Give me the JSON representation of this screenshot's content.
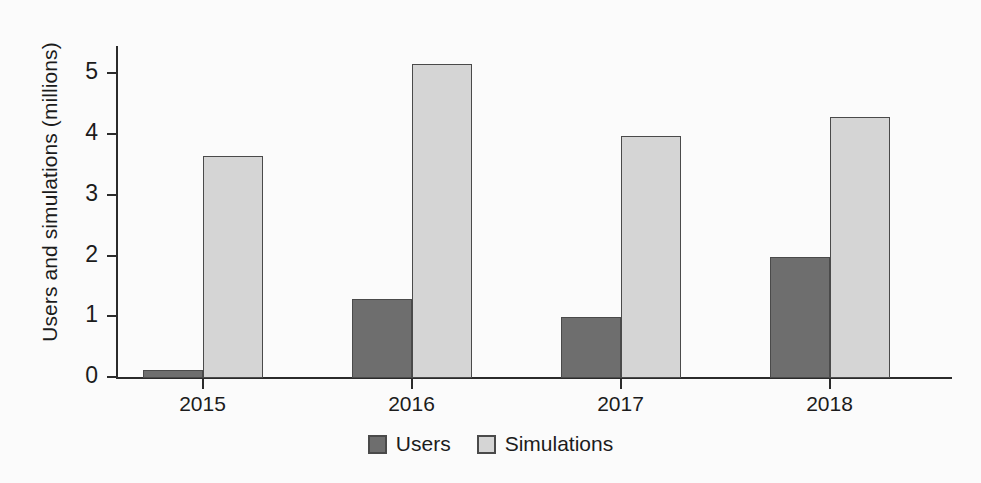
{
  "chart_data": {
    "type": "bar",
    "title": "",
    "subtitle": "",
    "xlabel": "",
    "ylabel": "Users and simulations (millions)",
    "categories": [
      "2015",
      "2016",
      "2017",
      "2018"
    ],
    "series": [
      {
        "name": "Users",
        "color": "#6e6e6e",
        "values": [
          0.13,
          1.3,
          1.0,
          2.0
        ]
      },
      {
        "name": "Simulations",
        "color": "#d5d5d5",
        "values": [
          3.65,
          5.17,
          3.99,
          4.29
        ]
      }
    ],
    "ylim": [
      0,
      5.45
    ],
    "yticks": [
      0,
      1,
      2,
      3,
      4,
      5
    ],
    "ytick_labels": [
      "0",
      "1",
      "2",
      "3",
      "4",
      "5"
    ],
    "grid": false,
    "legend_position": "bottom-center",
    "annotations": []
  },
  "figure": {
    "background_color": "#fbfbfb",
    "axis_color": "#2b2b2b",
    "text_color": "#1c1c1c"
  }
}
